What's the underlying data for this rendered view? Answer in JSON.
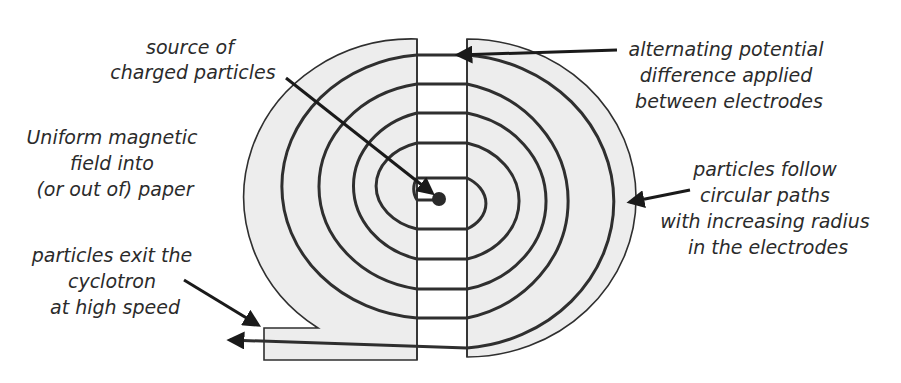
{
  "labels": {
    "source": [
      "source of",
      "charged particles"
    ],
    "alternating": [
      "alternating potential",
      "difference applied",
      "between electrodes"
    ],
    "magnetic": [
      "Uniform magnetic",
      "field into",
      "(or out of) paper"
    ],
    "circular": [
      "particles follow",
      "circular paths",
      "with increasing radius",
      "in the electrodes"
    ],
    "exit": [
      "particles exit the",
      "cyclotron",
      "at high speed"
    ]
  },
  "colors": {
    "electrode_fill": "#ededed",
    "line": "#2f2f2f",
    "text": "#2b2b2b",
    "background": "#ffffff"
  },
  "components": {
    "left_electrode": "D-shaped electrode (left)",
    "right_electrode": "D-shaped electrode (right)",
    "source": "particle source",
    "spiral": "particle path spiral",
    "exit_beam": "exit beam"
  }
}
